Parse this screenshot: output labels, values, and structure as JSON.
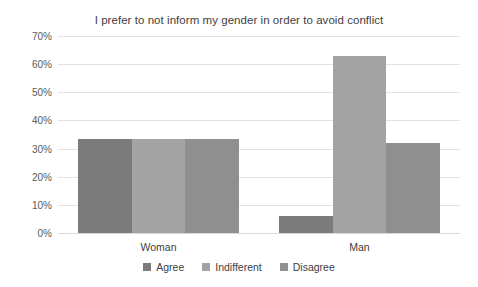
{
  "chart_data": {
    "type": "bar",
    "title": "I prefer to not inform my gender in order to avoid conflict",
    "xlabel": "",
    "ylabel": "",
    "categories": [
      "Woman",
      "Man"
    ],
    "series": [
      {
        "name": "Agree",
        "values": [
          33.3,
          6.0
        ],
        "color": "#7b7b7b"
      },
      {
        "name": "Indifferent",
        "values": [
          33.3,
          63.0
        ],
        "color": "#a3a3a3"
      },
      {
        "name": "Disagree",
        "values": [
          33.3,
          32.0
        ],
        "color": "#8f8f8f"
      }
    ],
    "ylim": [
      0,
      70
    ],
    "yticks": [
      "0%",
      "10%",
      "20%",
      "30%",
      "40%",
      "50%",
      "60%",
      "70%"
    ],
    "ytick_values": [
      0,
      10,
      20,
      30,
      40,
      50,
      60,
      70
    ],
    "grid": true,
    "legend_position": "bottom",
    "gridline_color": "#e2e2e2",
    "text_color": "#404040",
    "background": "#ffffff"
  }
}
